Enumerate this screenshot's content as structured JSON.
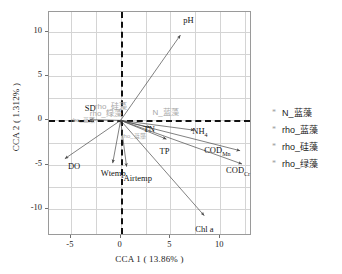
{
  "chart_data": {
    "type": "scatter",
    "title": "",
    "xlabel": "CCA 1 ( 13.86% )",
    "ylabel": "CCA 2 ( 1.312% )",
    "xlim": [
      -7.2,
      13.2
    ],
    "ylim": [
      -13.0,
      12.2
    ],
    "xticks": [
      "-5",
      "0",
      "5",
      "10"
    ],
    "xtick_values": [
      -5,
      0,
      5,
      10
    ],
    "yticks": [
      "10",
      "5",
      "0",
      "-5",
      "-10"
    ],
    "ytick_values": [
      10,
      5,
      0,
      -5,
      -10
    ],
    "grid": true,
    "zero_axes": "dashed",
    "legend_position": "right",
    "vectors": [
      {
        "label": "pH",
        "x": 6.0,
        "y": 9.6,
        "lx": 6.3,
        "ly": 11.3,
        "sub": ""
      },
      {
        "label": "NH",
        "x": 7.4,
        "y": -1.1,
        "lx": 7.2,
        "ly": -1.2,
        "sub": "4"
      },
      {
        "label": "COD",
        "x": 12.0,
        "y": -3.4,
        "lx": 8.4,
        "ly": -3.3,
        "sub": "Mn"
      },
      {
        "label": "COD",
        "x": 12.2,
        "y": -4.9,
        "lx": 10.6,
        "ly": -5.6,
        "sub": "Cr"
      },
      {
        "label": "TP",
        "x": 4.6,
        "y": -2.1,
        "lx": 3.9,
        "ly": -3.4,
        "sub": ""
      },
      {
        "label": "TN",
        "x": 3.0,
        "y": -0.8,
        "lx": 2.3,
        "ly": -1.0,
        "sub": ""
      },
      {
        "label": "Chl a",
        "x": 8.4,
        "y": -10.7,
        "lx": 7.5,
        "ly": -12.2,
        "sub": ""
      },
      {
        "label": "DO",
        "x": -5.6,
        "y": -4.3,
        "lx": -5.3,
        "ly": -5.1,
        "sub": ""
      },
      {
        "label": "Wtemp",
        "x": -0.8,
        "y": -4.8,
        "lx": -2.0,
        "ly": -5.9,
        "sub": ""
      },
      {
        "label": "Airtemp",
        "x": 0.6,
        "y": -5.2,
        "lx": 0.3,
        "ly": -6.5,
        "sub": ""
      },
      {
        "label": "SD",
        "x": -3.1,
        "y": 0.1,
        "lx": -3.6,
        "ly": 1.4,
        "sub": ""
      }
    ],
    "species_labels": [
      {
        "label": "N_蓝藻",
        "x": 3.2,
        "y": 1.1,
        "size": "normal"
      },
      {
        "label": "rho_硅藻",
        "x": -2.6,
        "y": 1.7,
        "size": "normal"
      },
      {
        "label": "rho_绿藻",
        "x": -3.1,
        "y": 0.9,
        "size": "normal"
      },
      {
        "label": "rho_蓝藻",
        "x": -5.0,
        "y": 0.0,
        "size": "tiny"
      },
      {
        "label": "rho_蓝藻",
        "x": 0.1,
        "y": -1.8,
        "size": "tiny"
      }
    ],
    "series": [
      {
        "name": "N_蓝藻",
        "marker": "asterisk"
      },
      {
        "name": "rho_蓝藻",
        "marker": "asterisk"
      },
      {
        "name": "rho_硅藻",
        "marker": "asterisk"
      },
      {
        "name": "rho_绿藻",
        "marker": "asterisk"
      }
    ]
  },
  "axes": {
    "x_title": "CCA 1 ( 13.86% )",
    "y_title": "CCA 2 ( 1.312% )"
  },
  "legend": {
    "items": [
      {
        "marker": "*",
        "label": "N_蓝藻"
      },
      {
        "marker": "*",
        "label": "rho_蓝藻"
      },
      {
        "marker": "*",
        "label": "rho_硅藻"
      },
      {
        "marker": "*",
        "label": "rho_绿藻"
      }
    ]
  },
  "colors": {
    "frame": "#9a9a9a",
    "grid": "#d4d4d4",
    "zero_axis": "#111111",
    "arrow": "#4a4a4a",
    "species_text": "#a8a8a8",
    "text": "#1a1a1a"
  }
}
